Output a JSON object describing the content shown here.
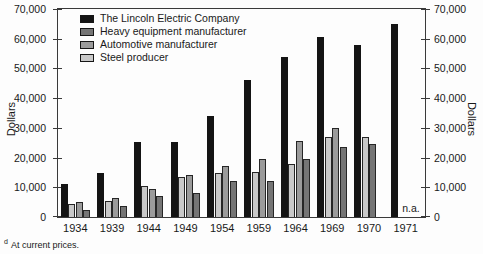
{
  "figure": {
    "left_axis_label": "Dollars",
    "right_axis_label": "Dollars",
    "na_label": "n.a.",
    "footnote_marker": "d",
    "footnote_text": "At current prices."
  },
  "chart_data": {
    "type": "bar",
    "title": "",
    "xlabel": "",
    "ylabel": "Dollars",
    "ylim": [
      0,
      70000
    ],
    "ytick_step": 10000,
    "ytick_labels": [
      "0",
      "10,000",
      "20,000",
      "30,000",
      "40,000",
      "50,000",
      "60,000",
      "70,000"
    ],
    "grid": false,
    "legend_position": "top-left",
    "categories": [
      "1934",
      "1939",
      "1944",
      "1949",
      "1954",
      "1959",
      "1964",
      "1969",
      "1970",
      "1971"
    ],
    "series": [
      {
        "name": "The Lincoln Electric Company",
        "color": "#141414",
        "values": [
          11000,
          14800,
          25400,
          25400,
          34000,
          46000,
          54000,
          60500,
          58000,
          65000
        ]
      },
      {
        "name": "Steel producer",
        "color": "#c9c9c9",
        "values": [
          4300,
          5500,
          10300,
          13300,
          14700,
          15000,
          18000,
          27000,
          27000,
          null
        ]
      },
      {
        "name": "Automotive manufacturer",
        "color": "#9b9b9b",
        "values": [
          5000,
          6500,
          9500,
          14200,
          17000,
          19500,
          25500,
          30000,
          null,
          null
        ]
      },
      {
        "name": "Heavy equipment manufacturer",
        "color": "#757575",
        "values": [
          2500,
          3800,
          7000,
          8200,
          12200,
          12000,
          19500,
          23500,
          24500,
          null
        ]
      }
    ],
    "legend": [
      {
        "label": "The Lincoln Electric Company",
        "color": "#141414"
      },
      {
        "label": "Heavy equipment manufacturer",
        "color": "#757575"
      },
      {
        "label": "Automotive manufacturer",
        "color": "#9b9b9b"
      },
      {
        "label": "Steel producer",
        "color": "#c9c9c9"
      }
    ],
    "na_categories": [
      "1971"
    ]
  }
}
